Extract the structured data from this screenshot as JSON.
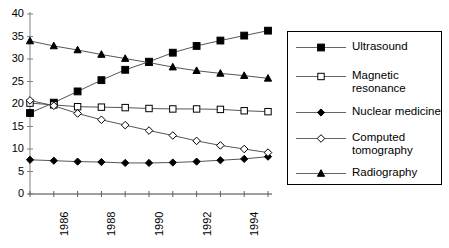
{
  "chart_data": {
    "type": "line",
    "title": "",
    "subtitle": "",
    "xlabel": "",
    "ylabel": "",
    "x": [
      1985,
      1986,
      1987,
      1988,
      1989,
      1990,
      1991,
      1992,
      1993,
      1994,
      1995
    ],
    "xlim": [
      1985,
      1995
    ],
    "ylim": [
      0,
      40
    ],
    "ytick_labels": [
      "0",
      "5",
      "10",
      "15",
      "20",
      "25",
      "30",
      "35",
      "40"
    ],
    "yticks": [
      0,
      5,
      10,
      15,
      20,
      25,
      30,
      35,
      40
    ],
    "xtick_labels": [
      "1986",
      "1988",
      "1990",
      "1992",
      "1994"
    ],
    "xticks_labeled": [
      1986,
      1988,
      1990,
      1992,
      1994
    ],
    "grid": false,
    "legend_position": "right",
    "series": [
      {
        "name": "Ultrasound",
        "marker": "filled-square",
        "color": "#000000",
        "values": [
          18.0,
          20.3,
          22.8,
          25.3,
          27.6,
          29.4,
          31.4,
          32.9,
          34.1,
          35.2,
          36.3
        ]
      },
      {
        "name": "Magnetic\nresonance",
        "marker": "open-square",
        "color": "#000000",
        "values": [
          20.2,
          19.8,
          19.4,
          19.3,
          19.2,
          19.0,
          18.9,
          18.9,
          18.8,
          18.5,
          18.3
        ]
      },
      {
        "name": "Nuclear medicine",
        "marker": "filled-diamond",
        "color": "#000000",
        "values": [
          7.6,
          7.4,
          7.2,
          7.1,
          6.9,
          6.9,
          7.0,
          7.2,
          7.5,
          7.8,
          8.3
        ]
      },
      {
        "name": "Computed\ntomography",
        "marker": "open-diamond",
        "color": "#000000",
        "values": [
          20.8,
          19.6,
          17.9,
          16.5,
          15.3,
          14.1,
          13.0,
          11.8,
          10.8,
          10.0,
          9.2
        ]
      },
      {
        "name": "Radiography",
        "marker": "filled-triangle",
        "color": "#000000",
        "values": [
          34.0,
          32.9,
          32.0,
          31.0,
          30.1,
          29.2,
          28.2,
          27.4,
          26.8,
          26.3,
          25.7
        ]
      }
    ]
  },
  "legend": {
    "entries": [
      {
        "label": "Ultrasound",
        "marker": "filled-square"
      },
      {
        "label": "Magnetic\nresonance",
        "marker": "open-square"
      },
      {
        "label": "Nuclear medicine",
        "marker": "filled-diamond"
      },
      {
        "label": "Computed\ntomography",
        "marker": "open-diamond"
      },
      {
        "label": "Radiography",
        "marker": "filled-triangle"
      }
    ]
  },
  "axes": {
    "y_axis_name": "value-axis",
    "x_axis_name": "year-axis"
  }
}
